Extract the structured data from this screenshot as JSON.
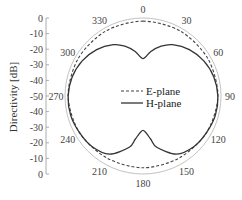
{
  "chart_data": {
    "type": "polar-line",
    "title": "",
    "ylabel": "Directivity [dB]",
    "radial_range": [
      -50,
      0
    ],
    "radial_ticks_upper": [
      "0",
      "-10",
      "-20",
      "-30",
      "-40",
      "-50"
    ],
    "radial_ticks_lower": [
      "-40",
      "-30",
      "-20",
      "-10",
      "0"
    ],
    "angle_ticks": [
      "0",
      "30",
      "60",
      "90",
      "120",
      "150",
      "180",
      "210",
      "240",
      "270",
      "300",
      "330"
    ],
    "legend": [
      {
        "name": "E-plane",
        "style": "dashed",
        "color": "#444444"
      },
      {
        "name": "H-plane",
        "style": "solid",
        "color": "#333333"
      }
    ],
    "grid": false,
    "outer_circle_color": "#bbbbbb",
    "series": [
      {
        "name": "E-plane",
        "angles_deg": [
          0,
          30,
          60,
          90,
          120,
          150,
          180,
          210,
          240,
          270,
          300,
          330
        ],
        "values_db": [
          -2,
          -2,
          -2,
          -2,
          -3,
          -4,
          -4,
          -4,
          -3,
          -2,
          -2,
          -2
        ]
      },
      {
        "name": "H-plane",
        "angles_deg": [
          0,
          10,
          20,
          30,
          45,
          60,
          75,
          90,
          105,
          120,
          135,
          150,
          165,
          170,
          180,
          190,
          195,
          210,
          225,
          240,
          255,
          270,
          285,
          300,
          315,
          330,
          340,
          350
        ],
        "values_db": [
          -26,
          -21,
          -16,
          -12,
          -8,
          -5,
          -3,
          -2,
          -2,
          -3,
          -4,
          -7,
          -16,
          -22,
          -28,
          -22,
          -16,
          -7,
          -4,
          -3,
          -2,
          -2,
          -3,
          -5,
          -8,
          -12,
          -16,
          -21
        ]
      }
    ]
  }
}
